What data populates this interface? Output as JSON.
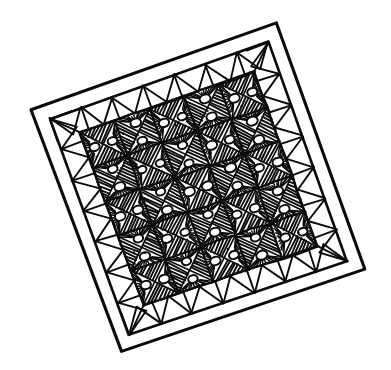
{
  "artwork": {
    "title": "Quilt",
    "subject": "hand-drawn quilt with fan and hatch patchwork",
    "medium": "black ink line drawing",
    "background_color": "#ffffff",
    "ink_color": "#0b0b0b",
    "caption": ""
  },
  "canvas": {
    "width": 391,
    "height": 370
  },
  "quilt": {
    "rotation_degrees": -19,
    "corners": {
      "left": {
        "x": 31,
        "y": 110
      },
      "top": {
        "x": 277,
        "y": 24
      },
      "right": {
        "x": 366,
        "y": 270
      },
      "bottom": {
        "x": 121,
        "y": 352
      }
    },
    "binding": {
      "name": "outer binding",
      "line_count": 2,
      "width_px": 11
    },
    "border_band": {
      "name": "plain triangle border",
      "motif": "alternating empty triangles",
      "triangles_per_side": 7
    },
    "field": {
      "name": "patchwork field",
      "rows": 5,
      "columns": 5,
      "block_count": 25,
      "block_type": "square split on both diagonals",
      "motifs": [
        "diagonal-hatch-triangle",
        "fan-sunburst-triangle"
      ],
      "fan_motif": {
        "name": "fan",
        "center_shape": "shell blob",
        "ray_count": 11
      },
      "hatch_motif": {
        "name": "hatching",
        "line_spacing_px": 4,
        "angle_degrees": 45
      }
    }
  }
}
